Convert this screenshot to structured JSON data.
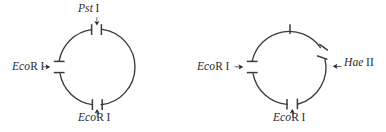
{
  "figure": {
    "type": "restriction-map-diagram",
    "background_color": "#ffffff",
    "stroke_color": "#3a3a44",
    "text_color": "#2b2b33",
    "panel_count": 2
  },
  "panels": [
    {
      "id": "left",
      "name": "plasmid-map-left",
      "circle": {
        "cx": 97,
        "cy": 67,
        "r": 38
      },
      "sites": [
        {
          "id": "pst-i-top",
          "label_genus": "Pst",
          "label_space": " ",
          "label_numeral": "I",
          "position": "top",
          "angle_deg": -90,
          "has_gap": true,
          "arrow": "down"
        },
        {
          "id": "ecori-west",
          "label_genus": "Eco",
          "label_roman": "R",
          "label_space": " ",
          "label_numeral": "I",
          "position": "left",
          "angle_deg": 180,
          "has_gap": true,
          "arrow": "right"
        },
        {
          "id": "ecori-bottom",
          "label_genus": "Eco",
          "label_roman": "R",
          "label_space": " ",
          "label_numeral": "I",
          "position": "bottom",
          "angle_deg": 90,
          "has_gap": true,
          "arrow": "up"
        }
      ]
    },
    {
      "id": "right",
      "name": "plasmid-map-right",
      "circle": {
        "cx": 290,
        "cy": 67,
        "r": 38
      },
      "sites": [
        {
          "id": "tick-top-unlabeled",
          "label_genus": "",
          "label_numeral": "",
          "position": "top",
          "angle_deg": -90,
          "has_gap": false,
          "arrow": "none"
        },
        {
          "id": "hae-ii-east",
          "label_genus": "Hae",
          "label_space": " ",
          "label_numeral": "II",
          "position": "right",
          "angle_deg": 25,
          "has_gap": true,
          "arrow": "left"
        },
        {
          "id": "ecori-west-right",
          "label_genus": "Eco",
          "label_roman": "R",
          "label_space": " ",
          "label_numeral": "I",
          "position": "left",
          "angle_deg": 180,
          "has_gap": true,
          "arrow": "right"
        },
        {
          "id": "ecori-bottom-right",
          "label_genus": "Eco",
          "label_roman": "R",
          "label_space": " ",
          "label_numeral": "I",
          "position": "bottom",
          "angle_deg": 80,
          "has_gap": true,
          "arrow": "up"
        }
      ]
    }
  ],
  "labels": {
    "pst_left": {
      "genus": "Pst",
      "numeral": "I"
    },
    "ecori_left_west": {
      "genus": "Eco",
      "roman": "R",
      "numeral": "I"
    },
    "ecori_left_bottom": {
      "genus": "Eco",
      "roman": "R",
      "numeral": "I"
    },
    "hae_right_east": {
      "genus": "Hae",
      "numeral": "II"
    },
    "ecori_right_west": {
      "genus": "Eco",
      "roman": "R",
      "numeral": "I"
    },
    "ecori_right_bottom": {
      "genus": "Eco",
      "roman": "R",
      "numeral": "I"
    }
  }
}
